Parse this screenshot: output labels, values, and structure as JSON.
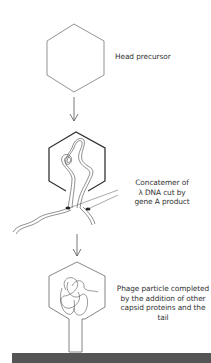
{
  "diagram": {
    "stages": [
      {
        "id": "head-precursor",
        "label_lines": [
          "Head precursor"
        ]
      },
      {
        "id": "concatemer",
        "label_lines": [
          "Concatemer of",
          "λ DNA cut by",
          "gene A product"
        ]
      },
      {
        "id": "phage-particle",
        "label_lines": [
          "Phage particle completed",
          "by the addition of other",
          "capsid proteins and the tail"
        ]
      }
    ],
    "colors": {
      "stroke": "#555555",
      "text": "#333333",
      "bar": "#555555",
      "marker": "#222222"
    }
  }
}
